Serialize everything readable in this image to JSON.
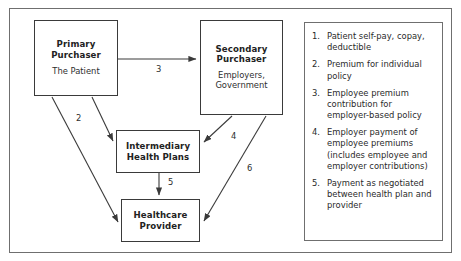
{
  "figure": {
    "nodes": [
      {
        "id": "primary",
        "title": "Primary Purchaser",
        "title_line1": "Primary",
        "title_line2": "Purchaser",
        "subtitle": "The Patient"
      },
      {
        "id": "secondary",
        "title": "Secondary Purchaser",
        "title_line1": "Secondary",
        "title_line2": "Purchaser",
        "subtitle_line1": "Employers,",
        "subtitle_line2": "Government"
      },
      {
        "id": "intermediary",
        "title_line1": "Intermediary",
        "title_line2": "Health Plans"
      },
      {
        "id": "provider",
        "title_line1": "Healthcare",
        "title_line2": "Provider"
      }
    ],
    "edge_labels": {
      "two": "2",
      "three": "3",
      "four": "4",
      "five": "5",
      "six": "6"
    },
    "edges": [
      {
        "label": "1",
        "from": "primary",
        "to": "provider",
        "shown_label": false
      },
      {
        "label": "2",
        "from": "primary",
        "to": "intermediary",
        "shown_label": true
      },
      {
        "label": "3",
        "from": "primary",
        "to": "secondary",
        "shown_label": true
      },
      {
        "label": "4",
        "from": "secondary",
        "to": "intermediary",
        "shown_label": true
      },
      {
        "label": "5",
        "from": "intermediary",
        "to": "provider",
        "shown_label": true
      },
      {
        "label": "6",
        "from": "secondary",
        "to": "provider",
        "shown_label": true
      }
    ]
  },
  "legend": {
    "items": [
      {
        "number": "1.",
        "text": "Patient self-pay, copay, deductible"
      },
      {
        "number": "2.",
        "text": "Premium for individual policy"
      },
      {
        "number": "3.",
        "text": "Employee premium contribution for employer-based policy"
      },
      {
        "number": "4.",
        "text": "Employer payment of employee premiums (includes employee and employer contributions)"
      },
      {
        "number": "5.",
        "text": "Payment as negotiated between health plan and provider"
      }
    ]
  },
  "colors": {
    "outer_border": "#6f6f6f",
    "node_border": "#3a3a3a",
    "arrow": "#3a3a3a",
    "text": "#2a2a2a",
    "background": "#ffffff"
  }
}
